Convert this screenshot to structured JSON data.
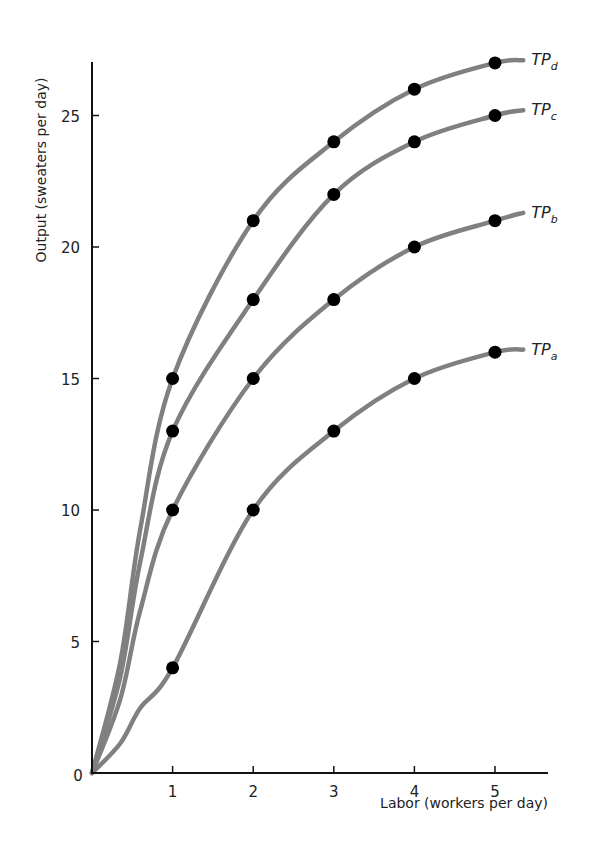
{
  "chart_data": {
    "type": "line",
    "title": "",
    "xlabel": "Labor (workers per day)",
    "ylabel": "Output (sweaters per day)",
    "x": [
      1,
      2,
      3,
      4,
      5
    ],
    "xlim": [
      0,
      5.6
    ],
    "ylim": [
      0,
      27.5
    ],
    "xticks": [
      1,
      2,
      3,
      4,
      5
    ],
    "yticks": [
      0,
      5,
      10,
      15,
      20,
      25
    ],
    "origin_label": "0",
    "grid": false,
    "legend": "inline labels at right end of each curve",
    "line_color": "#808080",
    "marker_color": "#000000",
    "series": [
      {
        "name": "TPa",
        "label_main": "TP",
        "label_sub": "a",
        "values": [
          4,
          10,
          13,
          15,
          16
        ],
        "end_value": 16.1
      },
      {
        "name": "TPb",
        "label_main": "TP",
        "label_sub": "b",
        "values": [
          10,
          15,
          18,
          20,
          21
        ],
        "end_value": 21.3
      },
      {
        "name": "TPc",
        "label_main": "TP",
        "label_sub": "c",
        "values": [
          13,
          18,
          22,
          24,
          25
        ],
        "end_value": 25.2
      },
      {
        "name": "TPd",
        "label_main": "TP",
        "label_sub": "d",
        "values": [
          15,
          21,
          24,
          26,
          27
        ],
        "end_value": 27.1
      }
    ]
  }
}
